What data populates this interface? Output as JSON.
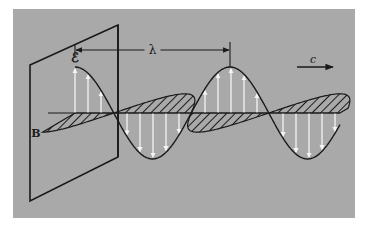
{
  "diagram": {
    "colors": {
      "page_bg": "#ffffff",
      "panel_bg": "#a9a9a9",
      "ink": "#1a1a1a",
      "e_arrows": "#f4f4f4"
    },
    "panel": {
      "x": 13,
      "y": 9,
      "w": 342,
      "h": 209
    },
    "plane": {
      "points": [
        [
          30,
          65
        ],
        [
          118,
          25
        ],
        [
          118,
          157
        ],
        [
          30,
          201
        ]
      ]
    },
    "wave": {
      "axis_y": 113,
      "start_x": 75,
      "end_x": 340,
      "wavelength_px": 155,
      "e_amplitude": 46,
      "b_amplitude": 12,
      "b_skew": 36,
      "e_arrow_spacing": 13
    },
    "labels": {
      "electric_field": "ℰ",
      "magnetic_field": "B",
      "wavelength": "λ",
      "speed": "c"
    },
    "wavelength_bracket": {
      "x1": 75,
      "x2": 230,
      "y": 50
    },
    "speed_arrow": {
      "x1": 297,
      "x2": 333,
      "y": 67
    }
  }
}
